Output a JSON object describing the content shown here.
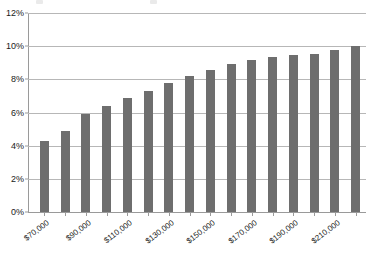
{
  "chart_data": {
    "type": "bar",
    "title": "",
    "subtitle": "",
    "xlabel": "",
    "ylabel": "",
    "ylim": [
      0,
      12
    ],
    "y_ticks": [
      "0%",
      "2%",
      "4%",
      "6%",
      "8%",
      "10%",
      "12%"
    ],
    "y_tick_values": [
      0,
      2,
      4,
      6,
      8,
      10,
      12
    ],
    "grid": true,
    "legend": "none",
    "categories": [
      "$70,000",
      "$80,000",
      "$90,000",
      "$100,000",
      "$110,000",
      "$120,000",
      "$130,000",
      "$140,000",
      "$150,000",
      "$160,000",
      "$170,000",
      "$180,000",
      "$190,000",
      "$200,000",
      "$210,000",
      "$220,000"
    ],
    "x_tick_labels": [
      "$70,000",
      "$90,000",
      "$110,000",
      "$130,000",
      "$150,000",
      "$170,000",
      "$190,000",
      "$210,000"
    ],
    "x_tick_label_indices": [
      0,
      2,
      4,
      6,
      8,
      10,
      12,
      14
    ],
    "values": [
      4.3,
      4.9,
      5.9,
      6.4,
      6.9,
      7.3,
      7.8,
      8.2,
      8.55,
      8.9,
      9.15,
      9.35,
      9.45,
      9.55,
      9.75,
      10.0
    ],
    "series": [
      {
        "name": "",
        "color": "#6e6e6e",
        "values": [
          4.3,
          4.9,
          5.9,
          6.4,
          6.9,
          7.3,
          7.8,
          8.2,
          8.55,
          8.9,
          9.15,
          9.35,
          9.45,
          9.55,
          9.75,
          10.0
        ]
      }
    ]
  },
  "colors": {
    "bar": "#6e6e6e",
    "gridline": "#b7b7b7",
    "axis": "#9a9a9a",
    "text": "#1a1a1a",
    "background": "#ffffff"
  }
}
